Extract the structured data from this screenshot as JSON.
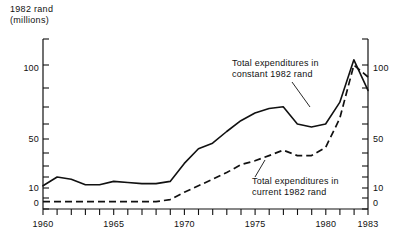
{
  "axis_title": "1982 rand\n(millions)",
  "annotations": {
    "constant": {
      "line1": "Total expenditures in",
      "line2": "constant 1982 rand"
    },
    "current": {
      "line1": "Total expenditures in",
      "line2": "current 1982 rand"
    }
  },
  "ticks": {
    "y_labels": [
      "100",
      "50",
      "10",
      "0"
    ],
    "x_labels": [
      "1960",
      "1965",
      "1970",
      "1975",
      "1980",
      "1983"
    ]
  },
  "colors": {
    "ink": "#111111",
    "background": "#ffffff"
  },
  "chart_data": {
    "type": "line",
    "title": "",
    "subtitle": "",
    "xlabel": "",
    "ylabel": "1982 rand (millions)",
    "xlim": [
      1960,
      1983
    ],
    "ylim": [
      0,
      130
    ],
    "yscale": "log-like",
    "grid": false,
    "legend_position": "in-plot-annotations",
    "y_ticks": [
      0,
      10,
      20,
      30,
      40,
      50,
      60,
      70,
      80,
      90,
      100,
      110
    ],
    "y_tick_labels": [
      "0",
      "10",
      "",
      "",
      "",
      "50",
      "",
      "",
      "",
      "",
      "100",
      ""
    ],
    "x_ticks": [
      1960,
      1961,
      1962,
      1963,
      1964,
      1965,
      1966,
      1967,
      1968,
      1969,
      1970,
      1971,
      1972,
      1973,
      1974,
      1975,
      1976,
      1977,
      1978,
      1979,
      1980,
      1981,
      1982,
      1983
    ],
    "x_tick_labels": [
      "1960",
      "1965",
      "1970",
      "1975",
      "1980",
      "1983"
    ],
    "x": [
      1960,
      1961,
      1962,
      1963,
      1964,
      1965,
      1966,
      1967,
      1968,
      1969,
      1970,
      1971,
      1972,
      1973,
      1974,
      1975,
      1976,
      1977,
      1978,
      1979,
      1980,
      1981,
      1982,
      1983
    ],
    "series": [
      {
        "name": "Total expenditures in constant 1982 rand",
        "style": "solid",
        "values": [
          11,
          15,
          14,
          11.5,
          11.5,
          13,
          12.5,
          12,
          12,
          13,
          22,
          33,
          37,
          45,
          53,
          60,
          65,
          67,
          50,
          48,
          50,
          72,
          104,
          88
        ]
      },
      {
        "name": "Total expenditures in current 1982 rand",
        "style": "dashed",
        "values": [
          3.5,
          3.5,
          3.5,
          3.5,
          3.5,
          3.5,
          3.5,
          3.5,
          3.5,
          4.5,
          8,
          11,
          14,
          17,
          21,
          24,
          28,
          32,
          28,
          28,
          34,
          55,
          100,
          95
        ]
      }
    ]
  }
}
